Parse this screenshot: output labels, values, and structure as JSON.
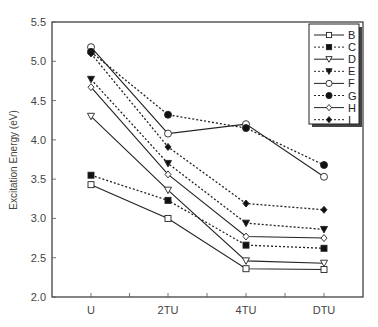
{
  "chart_data": {
    "type": "line",
    "title": "",
    "xlabel": "",
    "ylabel": "Excitation Energy (eV)",
    "categories": [
      "U",
      "2TU",
      "4TU",
      "DTU"
    ],
    "ylim": [
      2.0,
      5.5
    ],
    "yticks": [
      "2.0",
      "2.5",
      "3.0",
      "3.5",
      "4.0",
      "4.5",
      "5.0",
      "5.5"
    ],
    "grid": false,
    "legend_position": "upper right",
    "series": [
      {
        "name": "B",
        "line": "solid",
        "marker": "square",
        "filled": false,
        "values": [
          3.43,
          3.0,
          2.36,
          2.35
        ]
      },
      {
        "name": "C",
        "line": "dotted",
        "marker": "square",
        "filled": true,
        "values": [
          3.55,
          3.23,
          2.66,
          2.62
        ]
      },
      {
        "name": "D",
        "line": "solid",
        "marker": "triangle",
        "filled": false,
        "values": [
          4.3,
          3.36,
          2.46,
          2.43
        ]
      },
      {
        "name": "E",
        "line": "dotted",
        "marker": "triangle",
        "filled": true,
        "values": [
          4.77,
          3.7,
          2.94,
          2.86
        ]
      },
      {
        "name": "F",
        "line": "solid",
        "marker": "circle",
        "filled": false,
        "values": [
          5.18,
          4.08,
          4.2,
          3.53
        ]
      },
      {
        "name": "G",
        "line": "dotted",
        "marker": "circle",
        "filled": true,
        "values": [
          5.12,
          4.32,
          4.15,
          3.68
        ]
      },
      {
        "name": "H",
        "line": "solid",
        "marker": "diamond",
        "filled": false,
        "values": [
          4.67,
          3.56,
          2.77,
          2.75
        ]
      },
      {
        "name": "I",
        "line": "dotted",
        "marker": "diamond",
        "filled": true,
        "values": [
          5.1,
          3.91,
          3.19,
          3.11
        ]
      }
    ]
  }
}
